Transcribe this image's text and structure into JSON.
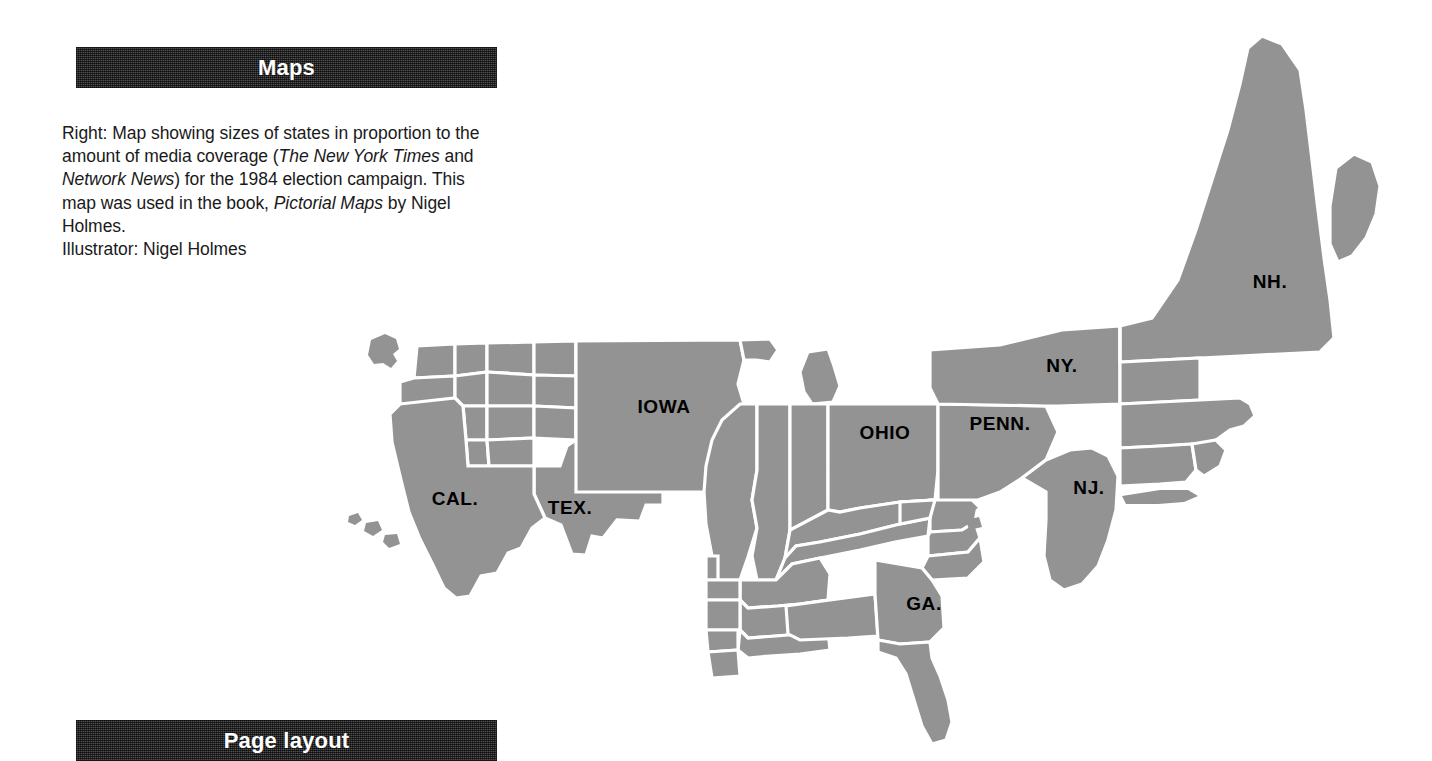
{
  "page": {
    "background": "#ffffff",
    "bar_color": "#3b3b3b",
    "map_fill": "#939393",
    "map_border": "#ffffff",
    "label_color": "#000000"
  },
  "sections": {
    "maps_heading": "Maps",
    "page_layout_heading": "Page layout"
  },
  "caption": {
    "line1_a": "Right: Map showing sizes of states in proportion to",
    "line2_a": "the amount of media coverage (",
    "line2_italic": "The New York Times",
    "line3_a": "and ",
    "line3_italic": "Network News",
    "line3_b": ") for the 1984 election campaign.",
    "line4_a": "This map was used in the book, ",
    "line4_italic": "Pictorial Maps",
    "line4_b": " by",
    "line5": "Nigel Holmes.",
    "line6": "Illustrator: Nigel Holmes"
  },
  "map": {
    "title": "1984 election campaign media coverage cartogram",
    "labels": [
      {
        "text": "IOWA",
        "x": 664,
        "y": 413
      },
      {
        "text": "CAL.",
        "x": 455,
        "y": 505
      },
      {
        "text": "TEX.",
        "x": 570,
        "y": 514
      },
      {
        "text": "OHIO",
        "x": 885,
        "y": 439
      },
      {
        "text": "PENN.",
        "x": 1000,
        "y": 430
      },
      {
        "text": "NY.",
        "x": 1062,
        "y": 372
      },
      {
        "text": "NJ.",
        "x": 1089,
        "y": 494
      },
      {
        "text": "NH.",
        "x": 1270,
        "y": 288
      },
      {
        "text": "GA.",
        "x": 924,
        "y": 610
      }
    ]
  }
}
